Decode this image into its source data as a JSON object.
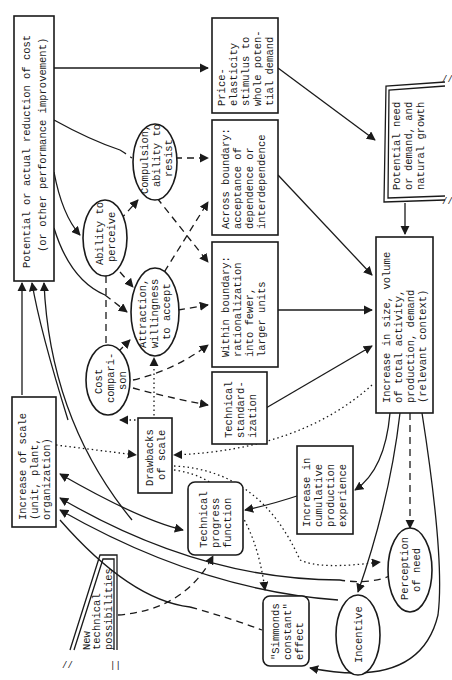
{
  "diagram": {
    "nodes": {
      "potential_reduction": {
        "lines": [
          "Potential or actual reduction of cost",
          "(or other performance improvement)"
        ],
        "shape": "box"
      },
      "price_elasticity": {
        "lines": [
          "Price-",
          "elasticity",
          "stimulus to",
          "whole poten-",
          "tial demand"
        ],
        "shape": "box"
      },
      "across_boundary": {
        "lines": [
          "Across boundary:",
          "acceptance of",
          "dependence or",
          "interdependence"
        ],
        "shape": "box"
      },
      "within_boundary": {
        "lines": [
          "Within boundary:",
          "rationalization",
          "into fewer,",
          "larger units"
        ],
        "shape": "box"
      },
      "technical_standardization": {
        "lines": [
          "Technical",
          "standard-",
          "ization"
        ],
        "shape": "box"
      },
      "potential_need": {
        "lines": [
          "Potential need",
          "or demand, and",
          "natural growth"
        ],
        "shape": "open-box"
      },
      "increase_size": {
        "lines": [
          "Increase in size, volume",
          "of total activity,",
          "production, demand",
          "(relevant context)"
        ],
        "shape": "box"
      },
      "ability_perceive": {
        "lines": [
          "Ability to",
          "perceive"
        ],
        "shape": "ellipse"
      },
      "compulsion": {
        "lines": [
          "Compulsion,",
          "ability to",
          "resist"
        ],
        "shape": "ellipse"
      },
      "attraction": {
        "lines": [
          "Attraction,",
          "willingness",
          "to accept"
        ],
        "shape": "ellipse"
      },
      "cost_comparison": {
        "lines": [
          "Cost",
          "compari-",
          "son"
        ],
        "shape": "ellipse"
      },
      "increase_scale": {
        "lines": [
          "Increase of scale",
          "(unit, plant,",
          "organization)"
        ],
        "shape": "box"
      },
      "drawbacks_scale": {
        "lines": [
          "Drawbacks",
          "of scale"
        ],
        "shape": "box"
      },
      "technical_progress": {
        "lines": [
          "Technical",
          "progress",
          "function"
        ],
        "shape": "rounded-box"
      },
      "cumulative_experience": {
        "lines": [
          "Increase in",
          "cumulative",
          "production",
          "experience"
        ],
        "shape": "box"
      },
      "new_possibilities": {
        "lines": [
          "New",
          "technical",
          "possibilities"
        ],
        "shape": "open-box"
      },
      "simmonds_effect": {
        "lines": [
          "\"Simmonds",
          "constant\"",
          "effect"
        ],
        "shape": "rounded-box"
      },
      "incentive": {
        "lines": [
          "Incentive"
        ],
        "shape": "ellipse"
      },
      "perception_need": {
        "lines": [
          "Perception",
          "of need"
        ],
        "shape": "ellipse"
      }
    },
    "edge_styles": [
      "solid",
      "dashed",
      "dotted"
    ]
  }
}
